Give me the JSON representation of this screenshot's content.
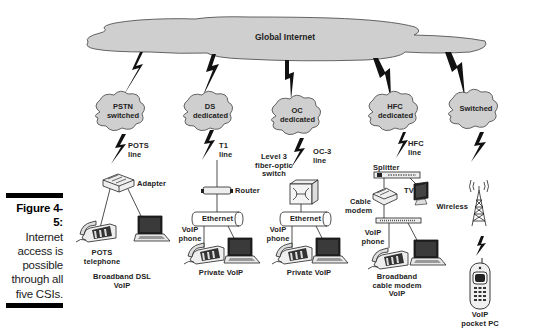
{
  "figure": {
    "number": "Figure 4-5:",
    "caption": [
      "Internet",
      "access is",
      "possible",
      "through all",
      "five CSIs."
    ]
  },
  "global_cloud": {
    "label": "Global Internet"
  },
  "columns": [
    {
      "cloud": [
        "PSTN",
        "switched"
      ],
      "link_label": [
        "POTS",
        "line"
      ],
      "device_label": "Adapter",
      "endpoint_labels": [
        "POTS",
        "telephone"
      ],
      "service": [
        "Broadband DSL",
        "VoIP"
      ]
    },
    {
      "cloud": [
        "DS",
        "dedicated"
      ],
      "link_label": [
        "T1",
        "line"
      ],
      "device_label": "Router",
      "network_label": "Ethernet",
      "endpoint_labels": [
        "VoIP",
        "phone"
      ],
      "service": [
        "Private VoIP"
      ]
    },
    {
      "cloud": [
        "OC",
        "dedicated"
      ],
      "link_label": [
        "OC-3",
        "line"
      ],
      "device_label": [
        "Level 3",
        "fiber-optic",
        "switch"
      ],
      "network_label": "Ethernet",
      "endpoint_labels": [
        "VoIP",
        "phone"
      ],
      "service": [
        "Private VoIP"
      ]
    },
    {
      "cloud": [
        "HFC",
        "dedicated"
      ],
      "link_label": [
        "HFC",
        "line"
      ],
      "splitter_label": "Splitter",
      "tv_label": "TV",
      "device_label": [
        "Cable",
        "modem"
      ],
      "endpoint_labels": [
        "VoIP",
        "phone"
      ],
      "service": [
        "Broadband",
        "cable modem",
        "VoIP"
      ]
    },
    {
      "cloud": [
        "Switched"
      ],
      "tower_label": "Wireless",
      "service": [
        "VoIP",
        "pocket PC"
      ]
    }
  ],
  "colors": {
    "cloud_fill": "#cfcfcf",
    "cloud_stroke": "#555555",
    "ink": "#111111",
    "background": "#ffffff"
  }
}
